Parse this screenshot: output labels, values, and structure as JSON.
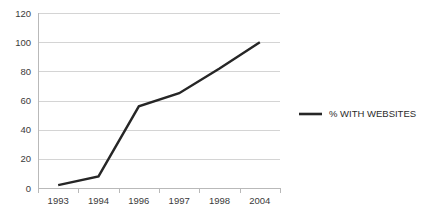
{
  "chart_data": {
    "type": "line",
    "title": "",
    "subtitle": "",
    "xlabel": "",
    "ylabel": "",
    "categories": [
      "1993",
      "1994",
      "1996",
      "1997",
      "1998",
      "2004"
    ],
    "series": [
      {
        "name": "% WITH WEBSITES",
        "values": [
          2,
          8,
          56,
          65,
          82,
          100
        ],
        "color": "#262626"
      }
    ],
    "ylim": [
      0,
      120
    ],
    "yticks": [
      0,
      20,
      40,
      60,
      80,
      100,
      120
    ],
    "ytick_labels": [
      "0",
      "20",
      "40",
      "60",
      "80",
      "100",
      "120"
    ],
    "xtick_labels": [
      "1993",
      "1994",
      "1996",
      "1997",
      "1998",
      "2004"
    ],
    "grid": "horizontal",
    "legend_position": "right",
    "legend_entries": [
      {
        "label": "% WITH WEBSITES",
        "color": "#262626"
      }
    ],
    "annotations": [],
    "colors": {
      "line": "#262626",
      "gridline": "#d4d4d4",
      "axis": "#b9b9b9",
      "text": "#3a3a3a",
      "background": "#ffffff"
    }
  }
}
